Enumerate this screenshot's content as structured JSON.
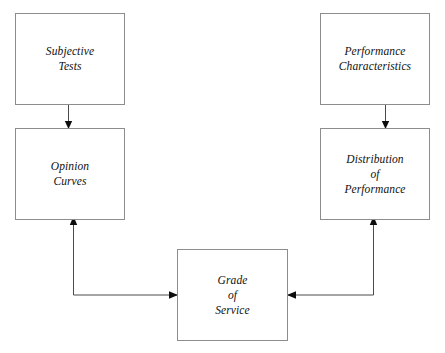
{
  "diagram": {
    "background_color": "#ffffff",
    "box_border_color": "#8d8d8d",
    "line_color": "#4a4a4a",
    "arrowhead_color": "#0d0d0d",
    "text_color": "#101010",
    "nodes": [
      {
        "id": "subjective-tests",
        "label": "Subjective\nTests",
        "x": 15,
        "y": 13,
        "width": 110,
        "height": 92
      },
      {
        "id": "opinion-curves",
        "label": "Opinion\nCurves",
        "x": 15,
        "y": 128,
        "width": 110,
        "height": 92
      },
      {
        "id": "performance-characteristics",
        "label": "Performance\nCharacteristics",
        "x": 320,
        "y": 13,
        "width": 110,
        "height": 92
      },
      {
        "id": "distribution-of-performance",
        "label": "Distribution\nof\nPerformance",
        "x": 320,
        "y": 128,
        "width": 110,
        "height": 92
      },
      {
        "id": "grade-of-service",
        "label": "Grade\nof\nService",
        "x": 177,
        "y": 249,
        "width": 111,
        "height": 92
      }
    ],
    "edges": [
      {
        "id": "subjective-tests-to-opinion-curves",
        "from": "subjective-tests",
        "to": "opinion-curves",
        "kind": "straight-down"
      },
      {
        "id": "performance-characteristics-to-distribution-of-performance",
        "from": "performance-characteristics",
        "to": "distribution-of-performance",
        "kind": "straight-down"
      },
      {
        "id": "opinion-curves-to-grade-of-service",
        "from": "opinion-curves",
        "to": "grade-of-service",
        "kind": "elbow-left"
      },
      {
        "id": "distribution-of-performance-to-grade-of-service",
        "from": "distribution-of-performance",
        "to": "grade-of-service",
        "kind": "elbow-right"
      }
    ]
  }
}
